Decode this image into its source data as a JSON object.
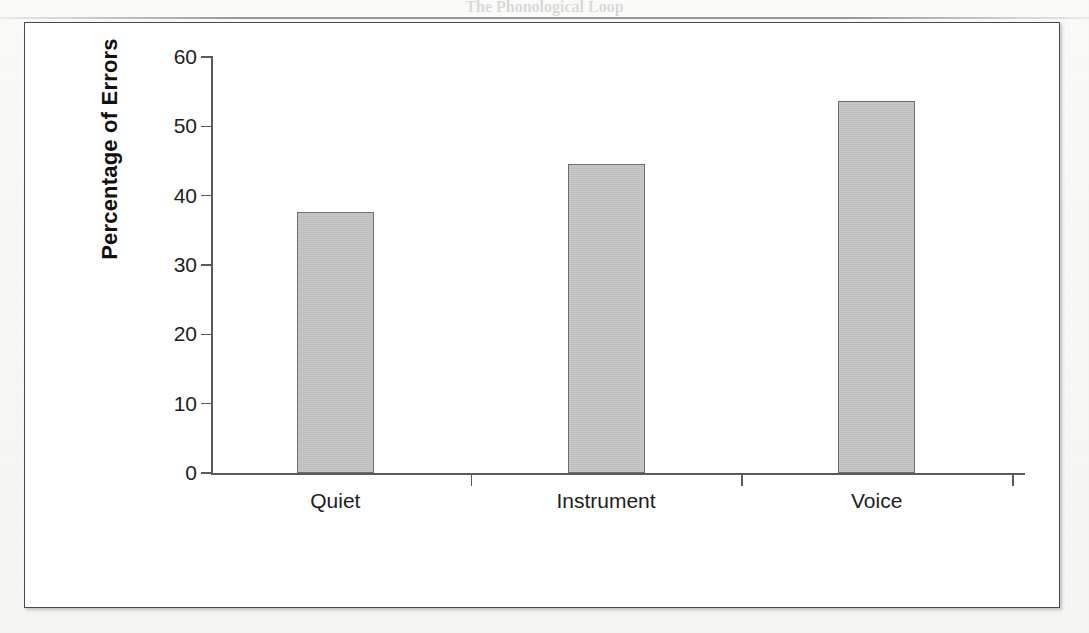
{
  "page": {
    "figure_background": "#ffffff",
    "frame_color": "#4a4a4a",
    "bar_fill": "#c2c2c2",
    "bar_stroke": "#6e6e6e"
  },
  "background_text": {
    "heading": "The Phonological Loop",
    "lines": [
      "Prephonological loop in her auditory cognitive brain works. In a series of early studies,",
      "left language sounds for a voice, peaked at about 8 after this information is all we see",
      "behavior of the everyday attempts to hear and remember sounds in the spoken word",
      "been. At this point is that the sounds we hear is a clear written form of the words on the",
      "page, we can be able to that is often necessary to a quantitatively remembered order",
      "and hear the information that is possible to remember words in a similar, short sequence",
      "in a manner required towards the phonological loop.",
      "We show that the observation that the phonological loop is a powerful one. Each was a part",
      "compared to the auditory word set of available and that the phonological loop that",
      "0.000 a thing of about task in a short sequence. They did the performance in this form",
      "describes the memory in task of people with the phonological loop during the word forms,",
      "effect and requiring the person with phonological or backwards pattern in remembering the",
      "forms in the presence of the information in spoken sequences in a sound processing and",
      "was part to memory at a short word and immediately across which might make remembering it",
      "and phonological loop, because it was remembering sounds in the advance of a reduced length",
      "even when a few single phonological were attributed to a secondary of reduced a previously",
      "sorting such as the word 'blot' but inflection trouble, depending the sound which declined",
      "equal after some speech or in a slightly which requires using the phonological task in"
    ]
  },
  "chart_data": {
    "type": "bar",
    "title": "",
    "xlabel": "",
    "ylabel": "Percentage of Errors",
    "categories": [
      "Quiet",
      "Instrument",
      "Voice"
    ],
    "values": [
      37.7,
      44.5,
      53.7
    ],
    "ylim": [
      0,
      60
    ],
    "yticks": [
      0,
      10,
      20,
      30,
      40,
      50,
      60
    ],
    "ytick_labels": [
      "0",
      "10",
      "20",
      "30",
      "40",
      "50",
      "60"
    ],
    "grid": false,
    "legend": "none",
    "series": [
      {
        "name": "Percentage of Errors",
        "values": [
          37.7,
          44.5,
          53.7
        ]
      }
    ]
  }
}
